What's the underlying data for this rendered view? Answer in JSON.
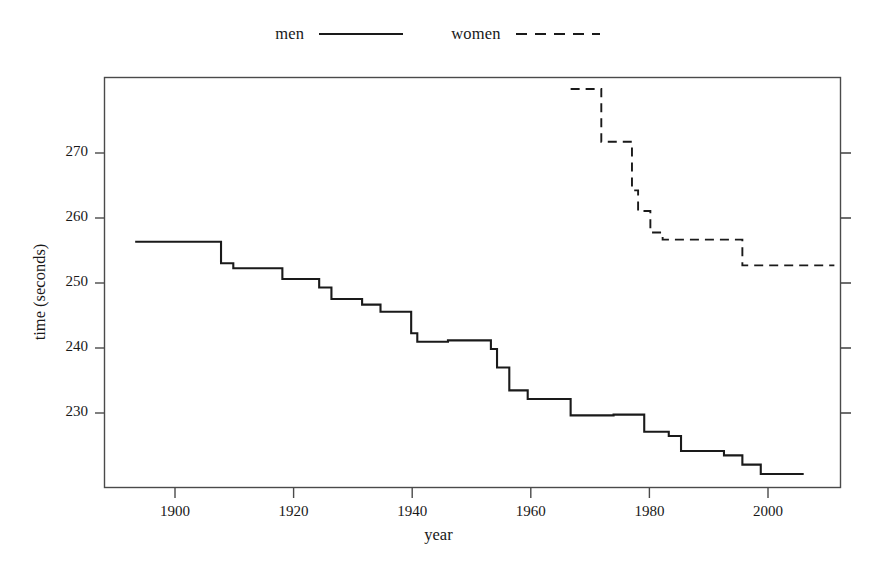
{
  "legend": {
    "position": "top-center",
    "entries": [
      {
        "label": "men",
        "style": "solid",
        "name": "legend-entry-men"
      },
      {
        "label": "women",
        "style": "dashed",
        "name": "legend-entry-women"
      }
    ]
  },
  "axes": {
    "xlabel": "year",
    "ylabel": "time (seconds)",
    "xticks": [
      "1900",
      "1920",
      "1940",
      "1960",
      "1980",
      "2000"
    ],
    "yticks": [
      "230",
      "240",
      "250",
      "260",
      "270"
    ],
    "xlim": [
      1891,
      2011
    ],
    "ylim": [
      221.2,
      278.6
    ],
    "grid": false,
    "box": true,
    "ticks_all_sides": true
  },
  "colors": {
    "line": "#1a1a1a",
    "axis": "#4a4a4a",
    "background": "#ffffff"
  },
  "chart_data": {
    "type": "line",
    "title": "",
    "subtitle": "",
    "xlabel": "year",
    "ylabel": "time (seconds)",
    "xlim": [
      1891,
      2011
    ],
    "ylim": [
      221.2,
      278.6
    ],
    "grid": false,
    "legend_position": "top-center",
    "step_type": "post",
    "series": [
      {
        "name": "men",
        "style": "solid",
        "x": [
          1896,
          1908,
          1910,
          1912,
          1917,
          1920,
          1924,
          1926,
          1928,
          1930,
          1933,
          1934,
          1936,
          1937,
          1941,
          1942,
          1943,
          1944,
          1947,
          1954,
          1955,
          1956,
          1957,
          1958,
          1960,
          1967,
          1974,
          1979,
          1980,
          1983,
          1985,
          1992,
          1995,
          1998,
          2005
        ],
        "y": [
          255.6,
          255.6,
          252.6,
          251.9,
          251.9,
          250.4,
          250.4,
          249.2,
          247.6,
          249.2,
          246.9,
          246.6,
          245.8,
          245.8,
          242.8,
          241.6,
          241.6,
          241.4,
          241.8,
          240.6,
          238.0,
          235.6,
          234.6,
          234.6,
          233.6,
          231.3,
          231.4,
          229.0,
          228.8,
          228.4,
          226.3,
          225.7,
          224.4,
          223.1,
          223.1
        ],
        "y_start": 255.6,
        "y_end": 223.1,
        "steps": [
          {
            "year": 1896,
            "time": 255.6
          },
          {
            "year": 1908,
            "time": 255.6
          },
          {
            "year": 1910,
            "time": 252.6
          },
          {
            "year": 1912,
            "time": 251.9
          },
          {
            "year": 1920,
            "time": 250.4
          },
          {
            "year": 1926,
            "time": 249.2
          },
          {
            "year": 1928,
            "time": 247.6
          },
          {
            "year": 1930,
            "time": 247.6
          },
          {
            "year": 1933,
            "time": 246.8
          },
          {
            "year": 1936,
            "time": 245.8
          },
          {
            "year": 1941,
            "time": 242.8
          },
          {
            "year": 1942,
            "time": 241.6
          },
          {
            "year": 1947,
            "time": 241.8
          },
          {
            "year": 1954,
            "time": 240.6
          },
          {
            "year": 1955,
            "time": 238.0
          },
          {
            "year": 1957,
            "time": 234.8
          },
          {
            "year": 1960,
            "time": 233.6
          },
          {
            "year": 1967,
            "time": 231.3
          },
          {
            "year": 1974,
            "time": 231.4
          },
          {
            "year": 1979,
            "time": 229.0
          },
          {
            "year": 1983,
            "time": 228.4
          },
          {
            "year": 1985,
            "time": 226.3
          },
          {
            "year": 1992,
            "time": 225.7
          },
          {
            "year": 1995,
            "time": 224.4
          },
          {
            "year": 1998,
            "time": 223.1
          },
          {
            "year": 2005,
            "time": 223.1
          }
        ]
      },
      {
        "name": "women",
        "style": "dashed",
        "x": [
          1967,
          1971,
          1972,
          1976,
          1977,
          1978,
          1980,
          1982,
          1993,
          1995,
          2010
        ],
        "y": [
          277.0,
          277.0,
          269.6,
          269.6,
          262.8,
          260.0,
          256.9,
          255.9,
          255.9,
          252.3,
          252.3
        ],
        "y_start": 277.0,
        "y_end": 252.3,
        "steps": [
          {
            "year": 1967,
            "time": 277.0
          },
          {
            "year": 1971,
            "time": 277.0
          },
          {
            "year": 1972,
            "time": 269.6
          },
          {
            "year": 1976,
            "time": 269.6
          },
          {
            "year": 1977,
            "time": 262.8
          },
          {
            "year": 1978,
            "time": 259.9
          },
          {
            "year": 1980,
            "time": 256.9
          },
          {
            "year": 1982,
            "time": 255.9
          },
          {
            "year": 1993,
            "time": 255.9
          },
          {
            "year": 1995,
            "time": 252.3
          },
          {
            "year": 2010,
            "time": 252.3
          }
        ]
      }
    ]
  }
}
